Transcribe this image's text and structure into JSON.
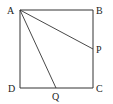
{
  "diagram": {
    "points": {
      "A": {
        "label": "A",
        "x": 20,
        "y": 10
      },
      "B": {
        "label": "B",
        "x": 93,
        "y": 10
      },
      "C": {
        "label": "C",
        "x": 93,
        "y": 88
      },
      "D": {
        "label": "D",
        "x": 20,
        "y": 88
      },
      "P": {
        "label": "P",
        "x": 93,
        "y": 49
      },
      "Q": {
        "label": "Q",
        "x": 56,
        "y": 88
      }
    },
    "segments": [
      "AB",
      "BC",
      "CD",
      "DA",
      "AP",
      "AQ"
    ]
  }
}
